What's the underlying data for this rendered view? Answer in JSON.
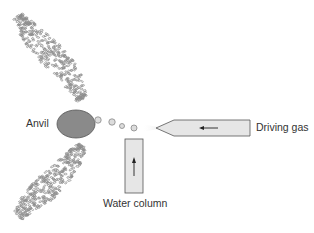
{
  "diagram": {
    "labels": {
      "anvil": "Anvil",
      "driving_gas": "Driving gas",
      "water_column": "Water column"
    },
    "colors": {
      "anvil_fill": "#8a8a8a",
      "anvil_stroke": "#555555",
      "nozzle_fill": "#e6e6e6",
      "outline": "#555555",
      "droplet_fill": "#d8d8d8",
      "spray": "#8c8c8c",
      "text": "#333333"
    }
  }
}
